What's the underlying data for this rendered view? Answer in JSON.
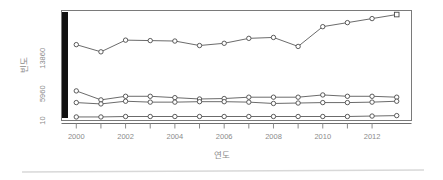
{
  "chart_data": {
    "type": "line",
    "title": "",
    "xlabel": "연도",
    "ylabel": "빈도",
    "x": [
      2000,
      2001,
      2002,
      2003,
      2004,
      2005,
      2006,
      2007,
      2008,
      2009,
      2010,
      2011,
      2012,
      2013
    ],
    "xtick_labels": [
      "2000",
      "2002",
      "2004",
      "2006",
      "2008",
      "2010",
      "2012"
    ],
    "xticks": [
      2000,
      2002,
      2004,
      2006,
      2008,
      2010,
      2012
    ],
    "ytick_labels": [
      "10",
      "5960",
      "13860"
    ],
    "yticks": [
      10,
      5960,
      13860
    ],
    "xlim": [
      1999.4,
      2013.6
    ],
    "ylim": [
      10,
      24500
    ],
    "grid": false,
    "legend": "none",
    "series": [
      {
        "name": "series-1",
        "marker": "circle",
        "values": [
          16900,
          15300,
          17900,
          17800,
          17700,
          16700,
          17200,
          18300,
          18500,
          16500,
          20900,
          21800,
          22700,
          23600
        ]
      },
      {
        "name": "series-2",
        "marker": "circle",
        "values": [
          6600,
          4600,
          5400,
          5400,
          5100,
          4800,
          4900,
          5200,
          5200,
          5200,
          5700,
          5400,
          5400,
          5200
        ]
      },
      {
        "name": "series-3",
        "marker": "circle",
        "values": [
          4000,
          3700,
          4300,
          4100,
          4100,
          4200,
          4200,
          4100,
          3800,
          3900,
          4000,
          4000,
          4100,
          4300
        ]
      },
      {
        "name": "series-4",
        "marker": "circle",
        "values": [
          800,
          800,
          900,
          900,
          900,
          900,
          900,
          900,
          900,
          900,
          900,
          900,
          1000,
          1100
        ]
      }
    ],
    "colors": {
      "line": "#5a5a5a",
      "marker_fill": "#ffffff",
      "marker_stroke": "#4a4a4a",
      "box": "#7a7a7a",
      "tick_text": "#8b8b8b",
      "black_bar": "#111111",
      "divider": "#d8d8d8",
      "background": "#ffffff"
    }
  }
}
